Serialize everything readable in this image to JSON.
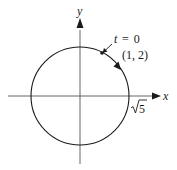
{
  "diagram": {
    "axes": {
      "x_label": "x",
      "y_label": "y"
    },
    "circle": {
      "radius_label": "√5",
      "radius_label_sqrt": "√",
      "radius_label_value": "5"
    },
    "start_point": {
      "parameter_label": "t = 0",
      "t_var": "t",
      "t_eq": "= 0",
      "coordinates": "(1, 2)"
    },
    "colors": {
      "stroke": "#1a1a1a",
      "background": "#ffffff"
    }
  }
}
